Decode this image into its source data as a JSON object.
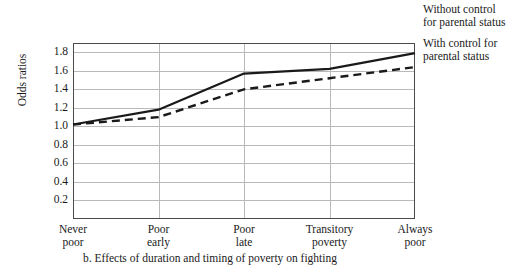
{
  "chart_data": {
    "type": "line",
    "title": "",
    "caption": "b. Effects of duration and timing of poverty on fighting",
    "xlabel": "",
    "ylabel": "Odds ratios",
    "categories": [
      "Never poor",
      "Poor early",
      "Poor late",
      "Transitory poverty",
      "Always poor"
    ],
    "category_lines": [
      [
        "Never",
        "poor"
      ],
      [
        "Poor",
        "early"
      ],
      [
        "Poor",
        "late"
      ],
      [
        "Transitory",
        "poverty"
      ],
      [
        "Always",
        "poor"
      ]
    ],
    "ylim": [
      0.0,
      1.9
    ],
    "yticks": [
      0.2,
      0.4,
      0.6,
      0.8,
      1.0,
      1.2,
      1.4,
      1.6,
      1.8
    ],
    "ytick_labels": [
      "0.2",
      "0.4",
      "0.6",
      "0.8",
      "1.0",
      "1.2",
      "1.4",
      "1.6",
      "1.8"
    ],
    "grid": "both",
    "legend_position": "right",
    "series": [
      {
        "name": "Without control for parental status",
        "style": "solid",
        "color": "#1a1a1a",
        "values": [
          1.02,
          1.18,
          1.57,
          1.62,
          1.79
        ]
      },
      {
        "name": "With control for parental status",
        "style": "dashed",
        "color": "#1a1a1a",
        "values": [
          1.02,
          1.1,
          1.4,
          1.52,
          1.64
        ]
      }
    ]
  },
  "legend": {
    "entries": [
      "Without control for parental status",
      "With control for parental status"
    ]
  }
}
